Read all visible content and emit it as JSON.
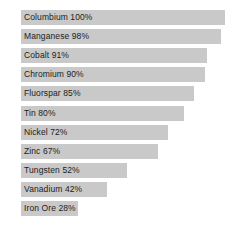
{
  "chart_data": {
    "type": "bar",
    "orientation": "horizontal",
    "title": "",
    "subtitle": "",
    "xlabel": "",
    "ylabel": "",
    "xlim": [
      0,
      100
    ],
    "grid": false,
    "legend": null,
    "value_unit": "%",
    "categories": [
      "Columbium",
      "Manganese",
      "Cobalt",
      "Chromium",
      "Fluorspar",
      "Tin",
      "Nickel",
      "Zinc",
      "Tungsten",
      "Vanadium",
      "Iron Ore"
    ],
    "values": [
      100,
      98,
      91,
      90,
      85,
      80,
      72,
      67,
      52,
      42,
      28
    ],
    "bar_labels": [
      "Columbium 100%",
      "Manganese 98%",
      "Cobalt 91%",
      "Chromium 90%",
      "Fluorspar 85%",
      "Tin 80%",
      "Nickel 72%",
      "Zinc 67%",
      "Tungsten 52%",
      "Vanadium 42%",
      "Iron Ore 28%"
    ],
    "colors": {
      "bar_fill": "#c9c9c9",
      "label_text": "#1c1c1c",
      "background": "#ffffff"
    }
  }
}
